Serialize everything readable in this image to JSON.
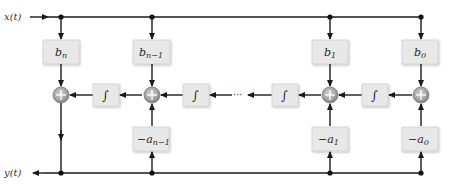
{
  "diagram": {
    "type": "block-diagram",
    "input_label": "x(t)",
    "output_label": "y(t)",
    "integrator_symbol": "∫",
    "ellipsis": "···",
    "feedforward_gains": [
      {
        "id": "b_n",
        "base": "b",
        "sub": "n"
      },
      {
        "id": "b_n-1",
        "base": "b",
        "sub": "n−1"
      },
      {
        "id": "b_1",
        "base": "b",
        "sub": "1"
      },
      {
        "id": "b_0",
        "base": "b",
        "sub": "0"
      }
    ],
    "feedback_gains": [
      {
        "id": "-a_n-1",
        "base": "−a",
        "sub": "n−1"
      },
      {
        "id": "-a_1",
        "base": "−a",
        "sub": "1"
      },
      {
        "id": "-a_0",
        "base": "−a",
        "sub": "0"
      }
    ],
    "summing_junction_symbol": "+",
    "colors": {
      "wire": "#1a1a1a",
      "box_fill": "#e8e8e8",
      "junction_fill": "#9a9a9a"
    }
  }
}
